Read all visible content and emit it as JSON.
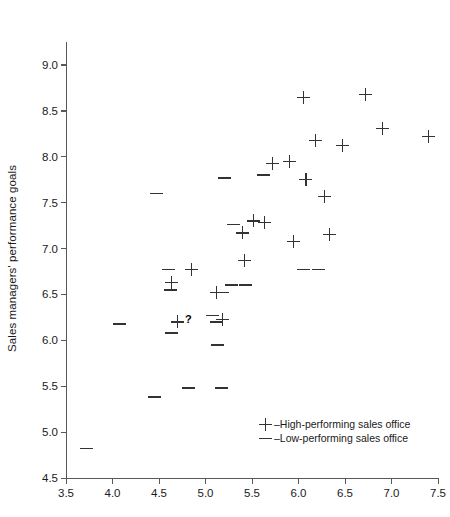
{
  "chart_data": {
    "type": "scatter",
    "title": "",
    "xlabel": "",
    "ylabel": "Sales managers' performance goals",
    "xlim": [
      3.5,
      7.5
    ],
    "ylim": [
      4.5,
      9.25
    ],
    "xticks": [
      "3.5",
      "4.0",
      "4.5",
      "5.0",
      "5.5",
      "6.0",
      "6.5",
      "7.0",
      "7.5"
    ],
    "xtick_values": [
      3.5,
      4.0,
      4.5,
      5.0,
      5.5,
      6.0,
      6.5,
      7.0,
      7.5
    ],
    "yticks": [
      "4.5",
      "5.0",
      "5.5",
      "6.0",
      "6.5",
      "7.0",
      "7.5",
      "8.0",
      "8.5",
      "9.0"
    ],
    "ytick_values": [
      4.5,
      5.0,
      5.5,
      6.0,
      6.5,
      7.0,
      7.5,
      8.0,
      8.5,
      9.0
    ],
    "grid": false,
    "legend_position": "lower-right",
    "series": [
      {
        "name": "High-performing sales office",
        "marker": "plus",
        "color": "#303436",
        "points": [
          [
            4.7,
            6.2
          ],
          [
            4.63,
            6.63
          ],
          [
            4.85,
            6.77
          ],
          [
            5.12,
            6.52
          ],
          [
            5.18,
            6.23
          ],
          [
            5.4,
            7.17
          ],
          [
            5.42,
            6.87
          ],
          [
            5.52,
            7.3
          ],
          [
            5.63,
            7.28
          ],
          [
            5.72,
            7.93
          ],
          [
            5.9,
            7.95
          ],
          [
            5.95,
            7.08
          ],
          [
            6.05,
            8.65
          ],
          [
            6.08,
            7.75
          ],
          [
            6.18,
            8.18
          ],
          [
            6.28,
            7.57
          ],
          [
            6.33,
            7.15
          ],
          [
            6.47,
            8.12
          ],
          [
            6.72,
            8.68
          ],
          [
            6.9,
            8.31
          ],
          [
            7.4,
            8.22
          ]
        ]
      },
      {
        "name": "Low-performing sales office",
        "marker": "dash",
        "color": "#303436",
        "points": [
          [
            3.72,
            4.82
          ],
          [
            4.07,
            6.18
          ],
          [
            4.45,
            5.38
          ],
          [
            4.6,
            6.77
          ],
          [
            4.62,
            6.55
          ],
          [
            4.63,
            6.08
          ],
          [
            4.82,
            5.48
          ],
          [
            4.47,
            7.6
          ],
          [
            5.12,
            6.2
          ],
          [
            5.13,
            5.95
          ],
          [
            5.2,
            7.77
          ],
          [
            5.28,
            6.6
          ],
          [
            5.43,
            6.6
          ],
          [
            5.3,
            7.26
          ],
          [
            5.18,
            6.52
          ],
          [
            5.62,
            7.8
          ],
          [
            5.17,
            5.48
          ],
          [
            6.05,
            6.77
          ],
          [
            6.22,
            6.77
          ],
          [
            5.08,
            6.27
          ]
        ]
      }
    ],
    "annotations": [
      {
        "text": "?",
        "x": 4.78,
        "y": 6.22
      }
    ]
  },
  "legend": {
    "items": [
      {
        "symbol": "plus",
        "label": "–High-performing sales office"
      },
      {
        "symbol": "dash",
        "label": "–Low-performing sales office"
      }
    ]
  }
}
